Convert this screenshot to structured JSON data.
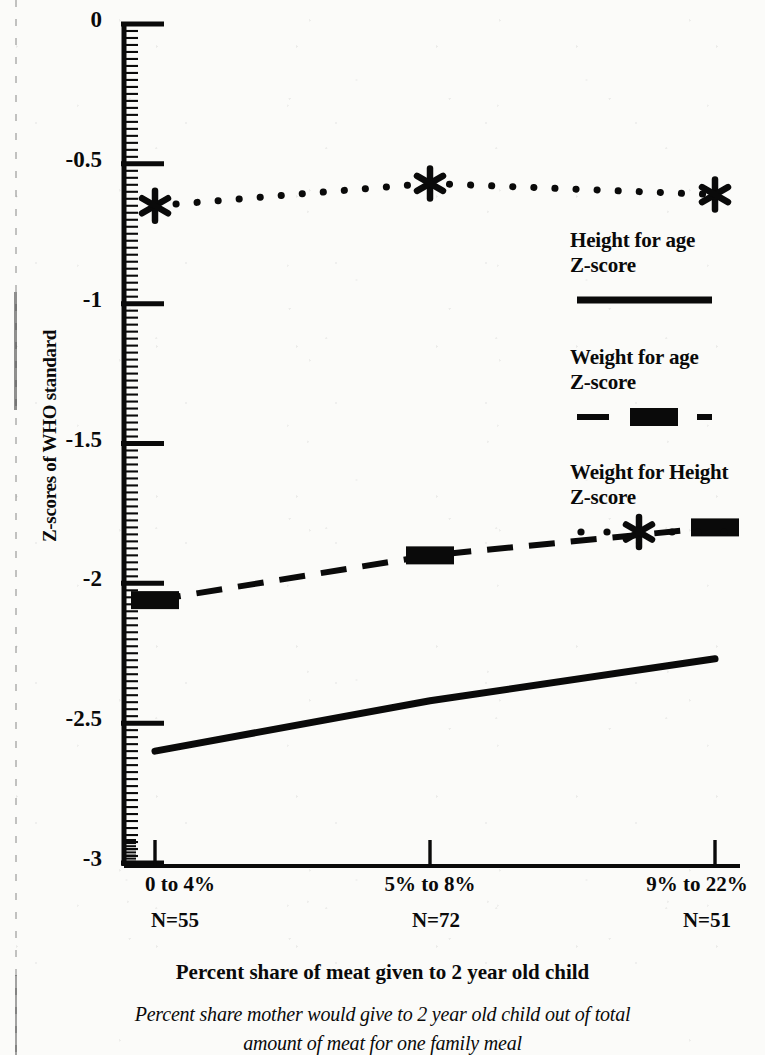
{
  "chart_data": {
    "type": "line",
    "title": "",
    "xlabel": "Percent share of meat given to 2 year old child",
    "ylabel": "Z-scores of WHO standard",
    "categories": [
      "0 to 4%",
      "5% to 8%",
      "9% to 22%"
    ],
    "category_counts": [
      "N=55",
      "N=72",
      "N=51"
    ],
    "ylim": [
      -3,
      0
    ],
    "yticks": [
      0,
      -0.5,
      -1,
      -1.5,
      -2,
      -2.5,
      -3
    ],
    "ytick_labels": [
      "0",
      "-0.5",
      "-1",
      "-1.5",
      "-2",
      "-2.5",
      "-3"
    ],
    "grid": false,
    "legend_position": "right",
    "series": [
      {
        "name": "Height for age Z-score",
        "style": "solid",
        "marker": "none",
        "values": [
          -2.6,
          -2.42,
          -2.27
        ]
      },
      {
        "name": "Weight for age Z-score",
        "style": "dashed",
        "marker": "square",
        "values": [
          -2.06,
          -1.9,
          -1.8
        ]
      },
      {
        "name": "Weight for Height Z-score",
        "style": "dotted",
        "marker": "asterisk",
        "values": [
          -0.65,
          -0.57,
          -0.61
        ]
      }
    ],
    "caption": "Percent share mother would give to 2 year old child out of total amount of meat for one family meal",
    "colors": {
      "ink": "#0a0a0a",
      "paper": "#fbfbf9"
    }
  },
  "legend": {
    "entries": [
      {
        "line1": "Height for age",
        "line2": "Z-score"
      },
      {
        "line1": "Weight for age",
        "line2": "Z-score"
      },
      {
        "line1": "Weight for Height",
        "line2": "Z-score"
      }
    ]
  },
  "caption": {
    "line1": "Percent share mother would give to 2 year old child out of total",
    "line2": "amount of meat for one family meal"
  }
}
